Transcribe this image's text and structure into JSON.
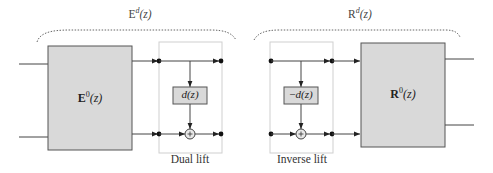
{
  "analysis": {
    "title": "E^d(z)",
    "title_base": "E",
    "title_sup": "d",
    "title_arg": "(z)",
    "block": {
      "base": "E",
      "sup": "0",
      "arg": "(z)"
    },
    "lift": {
      "caption": "Dual lift",
      "filter_label": "d(z)",
      "filter_fn": "d",
      "filter_arg": "(z)",
      "adder_symbol": "+"
    }
  },
  "synthesis": {
    "title": "R^d(z)",
    "title_base": "R",
    "title_sup": "d",
    "title_arg": "(z)",
    "block": {
      "base": "R",
      "sup": "0",
      "arg": "(z)"
    },
    "lift": {
      "caption": "Inverse lift",
      "filter_label": "−d(z)",
      "filter_prefix": "−",
      "filter_fn": "d",
      "filter_arg": "(z)",
      "adder_symbol": "+"
    }
  },
  "colors": {
    "block_fill": "#d9d9d9",
    "block_stroke": "#555555",
    "line": "#444444",
    "lift_box_stroke": "#cccccc",
    "brace": "#666666"
  }
}
